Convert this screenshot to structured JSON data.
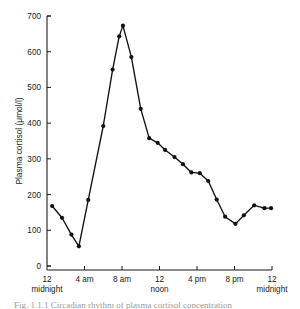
{
  "figure": {
    "caption": "Fig. 1.1.1  Circadian rhythm of plasma cortisol concentration"
  },
  "chart_data": {
    "type": "line",
    "title": "",
    "xlabel": "",
    "ylabel": "Plasma cortisol (μmol/l)",
    "ylim": [
      0,
      700
    ],
    "xlim": [
      0,
      24
    ],
    "yticks": [
      0,
      100,
      200,
      300,
      400,
      500,
      600,
      700
    ],
    "ytick_labels": [
      "0",
      "100",
      "200",
      "300",
      "400",
      "500",
      "600",
      "700"
    ],
    "xticks": [
      0,
      4,
      8,
      12,
      16,
      20,
      24
    ],
    "xtick_labels": [
      "12",
      "4 am",
      "8 am",
      "12",
      "4 pm",
      "8 pm",
      "12"
    ],
    "xtick_sublabels": [
      "midnight",
      "",
      "",
      "noon",
      "",
      "",
      "midnight"
    ],
    "grid": false,
    "legend": false,
    "legend_position": "none",
    "marker": "filled-circle",
    "x": [
      0.55,
      1.6,
      2.6,
      3.4,
      4.4,
      6.0,
      7.0,
      7.7,
      8.1,
      9.0,
      10.0,
      10.9,
      11.8,
      12.6,
      13.6,
      14.5,
      15.4,
      16.3,
      17.2,
      18.1,
      19.0,
      20.1,
      21.0,
      22.1,
      23.2,
      23.9
    ],
    "values": [
      168,
      135,
      88,
      55,
      185,
      392,
      550,
      643,
      673,
      585,
      440,
      358,
      345,
      325,
      305,
      285,
      262,
      260,
      238,
      186,
      138,
      118,
      142,
      170,
      162,
      162
    ],
    "units": "μmol/l",
    "series": [
      {
        "name": "Plasma cortisol",
        "values": [
          168,
          135,
          88,
          55,
          185,
          392,
          550,
          643,
          673,
          585,
          440,
          358,
          345,
          325,
          305,
          285,
          262,
          260,
          238,
          186,
          138,
          118,
          142,
          170,
          162,
          162
        ]
      }
    ]
  }
}
